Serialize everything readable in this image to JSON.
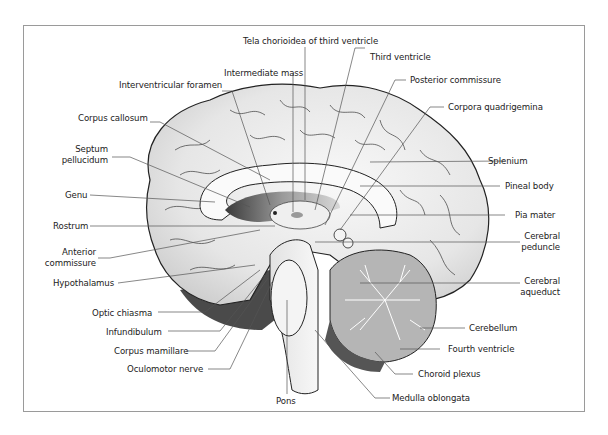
{
  "figure": {
    "type": "anatomical-diagram",
    "labels": {
      "tela_chorioidea": "Tela chorioidea of third ventricle",
      "intermediate_mass": "Intermediate mass",
      "interventricular_foramen": "Interventricular foramen",
      "corpus_callosum": "Corpus callosum",
      "septum_pellucidum_1": "Septum",
      "septum_pellucidum_2": "pellucidum",
      "genu": "Genu",
      "rostrum": "Rostrum",
      "anterior_commissure_1": "Anterior",
      "anterior_commissure_2": "commissure",
      "hypothalamus": "Hypothalamus",
      "optic_chiasma": "Optic chiasma",
      "infundibulum": "Infundibulum",
      "corpus_mamillare": "Corpus mamillare",
      "oculomotor_nerve": "Oculomotor nerve",
      "pons": "Pons",
      "third_ventricle": "Third ventricle",
      "posterior_commissure": "Posterior commissure",
      "corpora_quadrigemina": "Corpora quadrigemina",
      "splenium": "Splenium",
      "pineal_body": "Pineal body",
      "pia_mater": "Pia mater",
      "cerebral_peduncle_1": "Cerebral",
      "cerebral_peduncle_2": "peduncle",
      "cerebral_aqueduct_1": "Cerebral",
      "cerebral_aqueduct_2": "aqueduct",
      "cerebellum": "Cerebellum",
      "fourth_ventricle": "Fourth ventricle",
      "choroid_plexus": "Choroid plexus",
      "medulla_oblongata": "Medulla oblongata"
    },
    "colors": {
      "border": "#9a9a9a",
      "leader": "#555555",
      "cortex": "#e9e9e9",
      "cerebellum": "#b5b5b5",
      "dark": "#2a2a2a"
    }
  }
}
